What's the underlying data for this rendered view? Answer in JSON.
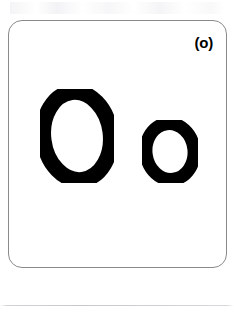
{
  "page": {
    "background_color": "#ffffff",
    "width": 234,
    "height": 317
  },
  "card": {
    "label": "(o)",
    "border_color": "#8a8a8a",
    "background_color": "#ffffff",
    "corner_radius_px": 14
  },
  "letters": {
    "ink_color": "#000000",
    "uppercase": {
      "character": "O",
      "case": "uppercase",
      "name": "letter-o-uppercase"
    },
    "lowercase": {
      "character": "o",
      "case": "lowercase",
      "name": "letter-o-lowercase"
    }
  },
  "footer": {
    "rule_color": "#cfcfd4"
  }
}
